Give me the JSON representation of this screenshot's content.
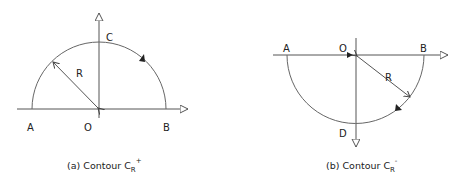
{
  "figure_a": {
    "caption_prefix": "(a) Contour C",
    "caption_sub": "R",
    "caption_sup": "+",
    "labels": {
      "A": "A",
      "O": "O",
      "B": "B",
      "C": "C",
      "R": "R"
    },
    "description": "Upper semicircle of radius R centered at O, traversed counter-clockwise from B through C to A"
  },
  "figure_b": {
    "caption_prefix": "(b) Contour C",
    "caption_sub": "R",
    "caption_sup": "-",
    "labels": {
      "A": "A",
      "O": "O",
      "B": "B",
      "D": "D",
      "R": "R"
    },
    "description": "Lower semicircle of radius R centered at O, traversed clockwise from B through D to A"
  },
  "colors": {
    "line": "#555555",
    "text": "#222222",
    "background": "#ffffff"
  }
}
